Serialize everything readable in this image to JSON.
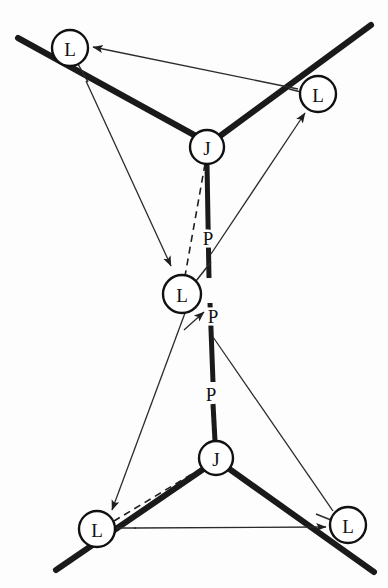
{
  "figure": {
    "type": "mechanism-kinematic-diagram",
    "width": 388,
    "height": 588,
    "background_color": "#fdfdfd",
    "ink_color": "#111111"
  },
  "nodes": [
    {
      "id": "L-top-left",
      "label": "L",
      "cx": 70,
      "cy": 48,
      "r": 18
    },
    {
      "id": "L-top-right",
      "label": "L",
      "cx": 318,
      "cy": 94,
      "r": 18
    },
    {
      "id": "J-top",
      "label": "J",
      "cx": 207,
      "cy": 147,
      "r": 17
    },
    {
      "id": "L-middle",
      "label": "L",
      "cx": 182,
      "cy": 294,
      "r": 19
    },
    {
      "id": "J-bottom",
      "label": "J",
      "cx": 216,
      "cy": 458,
      "r": 17
    },
    {
      "id": "L-bottom-left",
      "label": "L",
      "cx": 97,
      "cy": 529,
      "r": 18
    },
    {
      "id": "L-bottom-right",
      "label": "L",
      "cx": 348,
      "cy": 525,
      "r": 18
    }
  ],
  "edge_labels": [
    {
      "id": "P-upper",
      "label": "P",
      "x": 208,
      "y": 238
    },
    {
      "id": "P-middle",
      "label": "P",
      "x": 212,
      "y": 316
    },
    {
      "id": "P-lower",
      "label": "P",
      "x": 211,
      "y": 394
    }
  ],
  "links": {
    "thick_top_left": {
      "x1": 18,
      "y1": 38,
      "x2": 196,
      "y2": 136
    },
    "thick_top_right": {
      "x1": 220,
      "y1": 136,
      "x2": 371,
      "y2": 25
    },
    "thick_bottom_left": {
      "x1": 56,
      "y1": 570,
      "x2": 205,
      "y2": 468
    },
    "thick_bottom_right": {
      "x1": 228,
      "y1": 468,
      "x2": 374,
      "y2": 572
    },
    "rod_upper": {
      "x1": 207,
      "y1": 164,
      "x2": 209,
      "y2": 278
    },
    "rod_middle": {
      "x1": 210,
      "y1": 303,
      "x2": 213,
      "y2": 382
    },
    "rod_lower": {
      "x1": 213,
      "y1": 404,
      "x2": 215,
      "y2": 441
    }
  },
  "dashed_links": [
    {
      "id": "dash-top-J-to-middle-L",
      "x1": 205,
      "y1": 164,
      "x2": 185,
      "y2": 276
    },
    {
      "id": "dash-bottom-J-to-bottom-L",
      "x1": 202,
      "y1": 468,
      "x2": 114,
      "y2": 521
    }
  ],
  "leaders": [
    {
      "id": "leader-top-left-L",
      "x1": 78,
      "y1": 64,
      "x2": 88,
      "y2": 82
    },
    {
      "id": "leader-top-right-L",
      "x1": 300,
      "y1": 92,
      "x2": 290,
      "y2": 89
    },
    {
      "id": "leader-middle-L",
      "x1": 196,
      "y1": 281,
      "x2": 210,
      "y2": 263
    },
    {
      "id": "leader-bottom-left-L",
      "x1": 115,
      "y1": 528,
      "x2": 134,
      "y2": 528
    },
    {
      "id": "leader-bottom-right-L",
      "x1": 330,
      "y1": 521,
      "x2": 316,
      "y2": 516
    }
  ],
  "arrows": [
    {
      "id": "arrow-topright-to-topleft",
      "from": "L-top-right-leader",
      "to": "L-top-left",
      "x1": 298,
      "y1": 89,
      "x2": 91,
      "y2": 47
    },
    {
      "id": "arrow-topleft-to-middle",
      "from": "L-top-left-leader",
      "to": "L-middle",
      "x1": 86,
      "y1": 81,
      "x2": 170,
      "y2": 265
    },
    {
      "id": "arrow-rod-to-topright",
      "from": "rod-upper",
      "to": "L-top-right",
      "x1": 211,
      "y1": 254,
      "x2": 305,
      "y2": 112
    },
    {
      "id": "arrow-middle-to-P",
      "from": "L-middle",
      "to": "P-middle",
      "x1": 185,
      "y1": 330,
      "x2": 205,
      "y2": 313
    },
    {
      "id": "arrow-middle-to-bottomleft",
      "from": "L-middle",
      "to": "L-bottom-left",
      "x1": 184,
      "y1": 312,
      "x2": 111,
      "y2": 509
    },
    {
      "id": "arrow-rod-to-bottomright",
      "from": "rod-middle",
      "to": "L-bottom-right",
      "x1": 213,
      "y1": 337,
      "x2": 332,
      "y2": 510
    },
    {
      "id": "arrow-bottomleft-to-bottomright",
      "from": "L-bottom-left-leader",
      "to": "thick-bottom-right",
      "x1": 133,
      "y1": 528,
      "x2": 324,
      "y2": 527
    }
  ]
}
